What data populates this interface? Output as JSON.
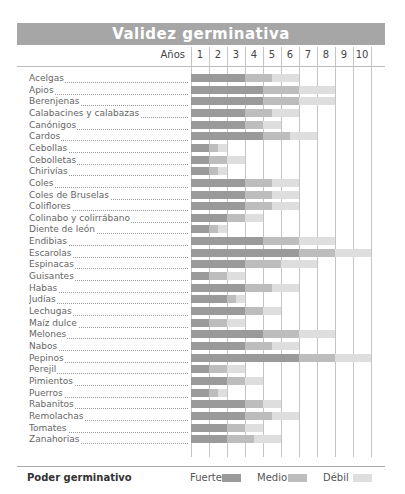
{
  "header": {
    "title": "Validez germinativa"
  },
  "axis": {
    "years_label": "Años",
    "years": [
      "1",
      "2",
      "3",
      "4",
      "5",
      "6",
      "7",
      "8",
      "9",
      "10"
    ]
  },
  "colors": {
    "fuerte": "#9a9a9a",
    "medio": "#bdbdbd",
    "debil": "#dedede",
    "header": "#a6a6a6"
  },
  "legend": {
    "title": "Poder germinativo",
    "fuerte": "Fuerte",
    "medio": "Medio",
    "debil": "Débil"
  },
  "chart_data": {
    "type": "bar",
    "title": "Validez germinativa",
    "xlabel": "Años",
    "x_ticks": [
      1,
      2,
      3,
      4,
      5,
      6,
      7,
      8,
      9,
      10
    ],
    "xlim": [
      0,
      10
    ],
    "orientation": "horizontal-stacked",
    "legend": [
      "Fuerte",
      "Medio",
      "Débil"
    ],
    "legend_title": "Poder germinativo",
    "categories": [
      "Acelgas",
      "Apios",
      "Berenjenas",
      "Calabacines y calabazas",
      "Canónigos",
      "Cardos",
      "Cebollas",
      "Cebolletas",
      "Chirivías",
      "Coles",
      "Coles de Bruselas",
      "Coliflores",
      "Colinabo y colirrábano",
      "Diente de león",
      "Endibias",
      "Escarolas",
      "Espinacas",
      "Guisantes",
      "Habas",
      "Judías",
      "Lechugas",
      "Maíz dulce",
      "Melones",
      "Nabos",
      "Pepinos",
      "Perejil",
      "Pimientos",
      "Puerros",
      "Rabanitos",
      "Remolachas",
      "Tomates",
      "Zanahorias"
    ],
    "series": [
      {
        "name": "Fuerte (hasta año)",
        "values": [
          3,
          4,
          4,
          3,
          3,
          4,
          1,
          1,
          1,
          3,
          3,
          3,
          2,
          1,
          4,
          6,
          3,
          1,
          3,
          2,
          3,
          1,
          4,
          3,
          6,
          1,
          2,
          1,
          3,
          3,
          2,
          2
        ]
      },
      {
        "name": "Medio (hasta año)",
        "values": [
          4.5,
          6,
          6,
          4.5,
          4,
          5.5,
          1.5,
          2,
          1.5,
          4.5,
          4.5,
          4.5,
          3,
          1.5,
          6,
          8,
          5,
          2,
          4.5,
          2.5,
          4,
          2,
          6,
          4.5,
          8,
          2,
          3,
          1.5,
          4,
          4.5,
          3,
          3.5
        ]
      },
      {
        "name": "Débil (hasta año)",
        "values": [
          6,
          8,
          8,
          6,
          5,
          7,
          2,
          3,
          2,
          6,
          6,
          6,
          4,
          2,
          8,
          10,
          7,
          3,
          6,
          3,
          5,
          3,
          8,
          6,
          10,
          3,
          4,
          2,
          5,
          6,
          4,
          5
        ]
      }
    ]
  }
}
